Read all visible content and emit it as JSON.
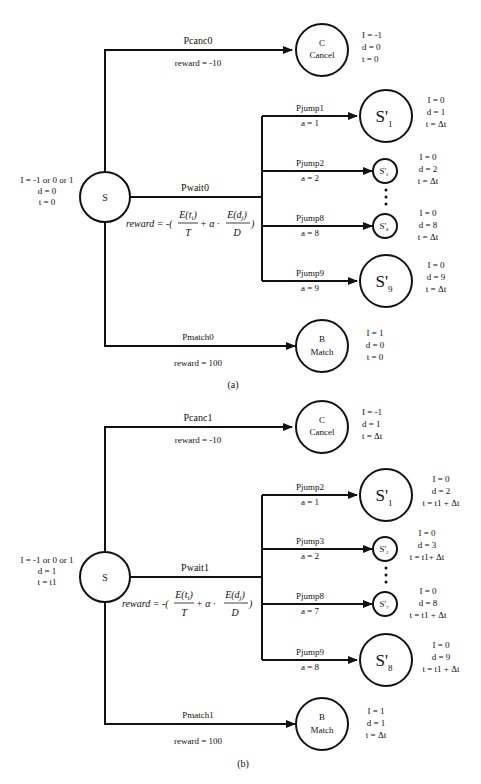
{
  "diagrams": [
    {
      "caption": "(a)",
      "source": {
        "label": "S",
        "vars": [
          "I = -1 or 0 or 1",
          "d = 0",
          "t = 0"
        ]
      },
      "cancel": {
        "prob": "Pcanc0",
        "reward": "reward = -10",
        "label1": "C",
        "label2": "Cancel",
        "vars": [
          "I = -1",
          "d = 0",
          "t = 0"
        ]
      },
      "wait": {
        "prob": "Pwait0",
        "reward_prefix": "reward = -(",
        "reward_num1": "E(t",
        "reward_den1": "T",
        "reward_mid": "+ α ·",
        "reward_num2": "E(d",
        "reward_den2": "D",
        "reward_suffix": ")"
      },
      "jumps": [
        {
          "prob": "Pjump1",
          "action": "a = 1",
          "state": "S'",
          "sub": "1",
          "vars": [
            "I = 0",
            "d = 1",
            "t = Δt"
          ]
        },
        {
          "prob": "Pjump2",
          "action": "a = 2",
          "state": "S'",
          "sub": "2",
          "vars": [
            "I = 0",
            "d = 2",
            "t = Δt"
          ]
        },
        {
          "prob": "Pjump8",
          "action": "a = 8",
          "state": "S'",
          "sub": "8",
          "vars": [
            "I = 0",
            "d = 8",
            "t = Δt"
          ]
        },
        {
          "prob": "Pjump9",
          "action": "a = 9",
          "state": "S'",
          "sub": "9",
          "vars": [
            "I = 0",
            "d = 9",
            "t = Δt"
          ]
        }
      ],
      "match": {
        "prob": "Pmatch0",
        "reward": "reward = 100",
        "label1": "B",
        "label2": "Match",
        "vars": [
          "I = 1",
          "d = 0",
          "t = 0"
        ]
      }
    },
    {
      "caption": "(b)",
      "source": {
        "label": "S",
        "vars": [
          "I = -1 or 0 or 1",
          "d = 1",
          "t = t1"
        ]
      },
      "cancel": {
        "prob": "Pcanc1",
        "reward": "reward = -10",
        "label1": "C",
        "label2": "Cancel",
        "vars": [
          "I = -1",
          "d = 1",
          "t = Δt"
        ]
      },
      "wait": {
        "prob": "Pwait1",
        "reward_prefix": "reward = -(",
        "reward_num1": "E(t",
        "reward_den1": "T",
        "reward_mid": "+ α ·",
        "reward_num2": "E(d",
        "reward_den2": "D",
        "reward_suffix": ")"
      },
      "jumps": [
        {
          "prob": "Pjump2",
          "action": "a = 1",
          "state": "S'",
          "sub": "1",
          "vars": [
            "I = 0",
            "d = 2",
            "t = t1 + Δt"
          ]
        },
        {
          "prob": "Pjump3",
          "action": "a = 2",
          "state": "S'",
          "sub": "2",
          "vars": [
            "I = 0",
            "d = 3",
            "t = t1+ Δt"
          ]
        },
        {
          "prob": "Pjump8",
          "action": "a = 7",
          "state": "S'",
          "sub": "7",
          "vars": [
            "I = 0",
            "d = 8",
            "t = t1 + Δt"
          ]
        },
        {
          "prob": "Pjump9",
          "action": "a = 8",
          "state": "S'",
          "sub": "8",
          "vars": [
            "I = 0",
            "d = 9",
            "t = t1 + Δt"
          ]
        }
      ],
      "match": {
        "prob": "Pmatch1",
        "reward": "reward = 100",
        "label1": "B",
        "label2": "Match",
        "vars": [
          "I = 1",
          "d = 1",
          "t = Δt"
        ]
      }
    }
  ]
}
